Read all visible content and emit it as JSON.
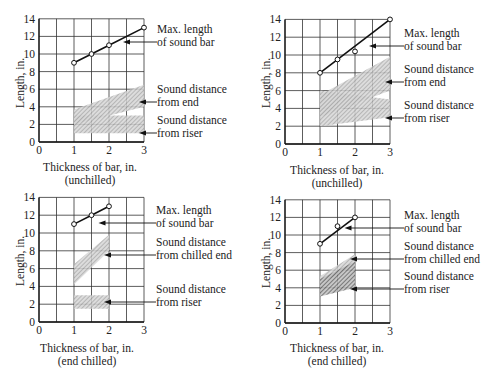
{
  "chart_data": [
    {
      "type": "line",
      "panel": "top-left",
      "title": "",
      "xlabel": "Thickness of bar, in.",
      "xlabel_sub": "(unchilled)",
      "ylabel": "Length, in.",
      "xlim": [
        0,
        3
      ],
      "ylim": [
        0,
        14
      ],
      "xticks": [
        0,
        1,
        2,
        3
      ],
      "yticks": [
        0,
        2,
        4,
        6,
        8,
        10,
        12,
        14
      ],
      "grid": true,
      "series": [
        {
          "name": "Max. length of sound bar",
          "kind": "line-markers",
          "x": [
            1,
            1.5,
            2,
            3
          ],
          "y": [
            9,
            10,
            11,
            13
          ]
        },
        {
          "name": "Sound distance from end",
          "kind": "band",
          "x": [
            1,
            3
          ],
          "lower": [
            2,
            4
          ],
          "upper": [
            3.7,
            6.5
          ]
        },
        {
          "name": "Sound distance from riser",
          "kind": "band",
          "x": [
            1,
            3
          ],
          "lower": [
            1,
            1
          ],
          "upper": [
            3,
            3
          ]
        }
      ],
      "annotations": [
        {
          "text": [
            "Max. length",
            "of sound bar"
          ],
          "points_to": "Max. length of sound bar"
        },
        {
          "text": [
            "Sound distance",
            "from end"
          ],
          "points_to": "Sound distance from end"
        },
        {
          "text": [
            "Sound distance",
            "from riser"
          ],
          "points_to": "Sound distance from riser"
        }
      ]
    },
    {
      "type": "line",
      "panel": "top-right",
      "title": "",
      "xlabel": "Thickness of bar, in.",
      "xlabel_sub": "(unchilled)",
      "ylabel": "Length, in.",
      "xlim": [
        0,
        3
      ],
      "ylim": [
        0,
        14
      ],
      "xticks": [
        0,
        1,
        2,
        3
      ],
      "yticks": [
        0,
        2,
        4,
        6,
        8,
        10,
        12,
        14
      ],
      "grid": true,
      "series": [
        {
          "name": "Max. length of sound bar",
          "kind": "line-markers",
          "x": [
            1,
            1.5,
            2,
            3
          ],
          "y": [
            8,
            9.5,
            10.4,
            14
          ],
          "line": {
            "x": [
              1,
              3
            ],
            "y": [
              8,
              14
            ]
          }
        },
        {
          "name": "Sound distance from end",
          "kind": "band",
          "x": [
            1,
            3
          ],
          "lower": [
            3,
            6
          ],
          "upper": [
            5.5,
            9.8
          ]
        },
        {
          "name": "Sound distance from riser",
          "kind": "band",
          "x": [
            1,
            3
          ],
          "lower": [
            2,
            3
          ],
          "upper": [
            6,
            5
          ]
        }
      ],
      "annotations": [
        {
          "text": [
            "Max. length",
            "of sound bar"
          ],
          "points_to": "Max. length of sound bar"
        },
        {
          "text": [
            "Sound distance",
            "from end"
          ],
          "points_to": "Sound distance from end"
        },
        {
          "text": [
            "Sound distance",
            "from riser"
          ],
          "points_to": "Sound distance from riser"
        }
      ]
    },
    {
      "type": "line",
      "panel": "bottom-left",
      "title": "",
      "xlabel": "Thickness of bar, in.",
      "xlabel_sub": "(end chilled)",
      "ylabel": "Length, in.",
      "xlim": [
        0,
        3
      ],
      "ylim": [
        0,
        14
      ],
      "xticks": [
        0,
        1,
        2,
        3
      ],
      "yticks": [
        0,
        2,
        4,
        6,
        8,
        10,
        12,
        14
      ],
      "grid": true,
      "series": [
        {
          "name": "Max. length of sound bar",
          "kind": "line-markers",
          "x": [
            1,
            1.5,
            2
          ],
          "y": [
            11,
            12,
            13
          ]
        },
        {
          "name": "Sound distance from chilled end",
          "kind": "band",
          "x": [
            1,
            2
          ],
          "lower": [
            4.2,
            8
          ],
          "upper": [
            6.5,
            9.8
          ]
        },
        {
          "name": "Sound distance from riser",
          "kind": "band",
          "x": [
            1,
            2
          ],
          "lower": [
            1.5,
            1.5
          ],
          "upper": [
            3,
            3
          ]
        }
      ],
      "annotations": [
        {
          "text": [
            "Max. length",
            "of sound bar"
          ],
          "points_to": "Max. length of sound bar"
        },
        {
          "text": [
            "Sound distance",
            "from chilled end"
          ],
          "points_to": "Sound distance from chilled end"
        },
        {
          "text": [
            "Sound distance",
            "from riser"
          ],
          "points_to": "Sound distance from riser"
        }
      ]
    },
    {
      "type": "line",
      "panel": "bottom-right",
      "title": "",
      "xlabel": "Thickness of bar, in.",
      "xlabel_sub": "(end chilled)",
      "ylabel": "Length, in.",
      "xlim": [
        0,
        3
      ],
      "ylim": [
        0,
        14
      ],
      "xticks": [
        0,
        1,
        2,
        3
      ],
      "yticks": [
        0,
        2,
        4,
        6,
        8,
        10,
        12,
        14
      ],
      "grid": true,
      "series": [
        {
          "name": "Max. length of sound bar",
          "kind": "line-markers",
          "x": [
            1,
            1.5,
            2
          ],
          "y": [
            9,
            11,
            12
          ],
          "line": {
            "x": [
              1,
              2
            ],
            "y": [
              9,
              12
            ]
          }
        },
        {
          "name": "Sound distance from chilled end",
          "kind": "band",
          "x": [
            1,
            2
          ],
          "lower": [
            4.5,
            6.5
          ],
          "upper": [
            5.3,
            7.8
          ]
        },
        {
          "name": "Sound distance from riser",
          "kind": "band",
          "x": [
            1,
            2
          ],
          "lower": [
            3,
            4
          ],
          "upper": [
            5,
            7
          ]
        }
      ],
      "annotations": [
        {
          "text": [
            "Max. length",
            "of sound bar"
          ],
          "points_to": "Max. length of sound bar"
        },
        {
          "text": [
            "Sound distance",
            "from chilled end"
          ],
          "points_to": "Sound distance from chilled end"
        },
        {
          "text": [
            "Sound distance",
            "from riser"
          ],
          "points_to": "Sound distance from riser"
        }
      ]
    }
  ]
}
